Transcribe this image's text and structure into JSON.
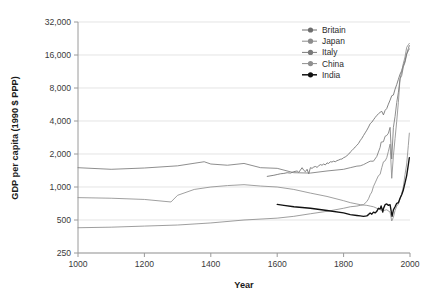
{
  "chart_data": {
    "type": "line",
    "title": "",
    "xlabel": "Year",
    "ylabel": "GDP per capita (1990 $ PPP)",
    "xlim": [
      1000,
      2000
    ],
    "ylim": [
      250,
      32000
    ],
    "yscale": "log2",
    "grid": true,
    "legend_position": "top-right",
    "xticks": [
      "1000",
      "1200",
      "1400",
      "1600",
      "1800",
      "2000"
    ],
    "xtick_values": [
      1000,
      1200,
      1400,
      1600,
      1800,
      2000
    ],
    "yticks": [
      "250",
      "500",
      "1,000",
      "2,000",
      "4,000",
      "8,000",
      "16,000",
      "32,000"
    ],
    "ytick_values": [
      250,
      500,
      1000,
      2000,
      4000,
      8000,
      16000,
      32000
    ],
    "series": [
      {
        "name": "Britain",
        "color": "#6e6e6e",
        "marker": "circle",
        "x": [
          1570,
          1590,
          1600,
          1610,
          1620,
          1630,
          1640,
          1650,
          1660,
          1665,
          1670,
          1675,
          1680,
          1685,
          1690,
          1695,
          1700,
          1705,
          1710,
          1715,
          1720,
          1725,
          1730,
          1735,
          1740,
          1745,
          1750,
          1755,
          1760,
          1765,
          1770,
          1775,
          1780,
          1785,
          1790,
          1795,
          1800,
          1805,
          1810,
          1815,
          1820,
          1825,
          1830,
          1835,
          1840,
          1845,
          1850,
          1855,
          1860,
          1865,
          1870,
          1875,
          1880,
          1885,
          1890,
          1895,
          1900,
          1905,
          1910,
          1915,
          1920,
          1925,
          1930,
          1935,
          1940,
          1945,
          1950,
          1955,
          1960,
          1965,
          1970,
          1975,
          1980,
          1985,
          1990,
          1995,
          1998
        ],
        "y": [
          1250,
          1280,
          1300,
          1320,
          1330,
          1350,
          1340,
          1380,
          1400,
          1360,
          1430,
          1500,
          1420,
          1380,
          1450,
          1320,
          1500,
          1480,
          1520,
          1540,
          1510,
          1560,
          1600,
          1580,
          1620,
          1590,
          1660,
          1640,
          1700,
          1690,
          1720,
          1700,
          1740,
          1760,
          1790,
          1800,
          1850,
          1880,
          1930,
          1990,
          2080,
          2150,
          2230,
          2320,
          2400,
          2500,
          2650,
          2780,
          2950,
          3120,
          3300,
          3520,
          3780,
          3900,
          4100,
          4300,
          4500,
          4650,
          4800,
          4900,
          4550,
          5000,
          5200,
          5700,
          6200,
          6800,
          6900,
          7800,
          8600,
          9600,
          10700,
          11500,
          12900,
          14200,
          16400,
          18300,
          19500
        ]
      },
      {
        "name": "Japan",
        "color": "#8c8c8c",
        "marker": "circle",
        "x": [
          1000,
          1100,
          1200,
          1300,
          1400,
          1500,
          1600,
          1650,
          1700,
          1750,
          1800,
          1820,
          1840,
          1850,
          1860,
          1870,
          1875,
          1880,
          1885,
          1890,
          1895,
          1900,
          1905,
          1910,
          1915,
          1920,
          1925,
          1930,
          1935,
          1940,
          1945,
          1950,
          1955,
          1960,
          1965,
          1970,
          1975,
          1980,
          1985,
          1990,
          1995,
          1998
        ],
        "y": [
          425,
          430,
          440,
          450,
          470,
          500,
          520,
          540,
          570,
          600,
          640,
          660,
          670,
          680,
          690,
          737,
          780,
          850,
          900,
          1012,
          1090,
          1180,
          1270,
          1304,
          1500,
          1696,
          1730,
          1850,
          2120,
          2460,
          1200,
          1921,
          2770,
          3986,
          5930,
          9714,
          11344,
          13428,
          15331,
          18789,
          19850,
          20400
        ]
      },
      {
        "name": "Italy",
        "color": "#7a7a7a",
        "marker": "circle",
        "x": [
          1000,
          1100,
          1200,
          1300,
          1380,
          1400,
          1450,
          1500,
          1550,
          1600,
          1650,
          1700,
          1750,
          1800,
          1820,
          1840,
          1850,
          1860,
          1870,
          1880,
          1890,
          1900,
          1910,
          1913,
          1920,
          1925,
          1930,
          1935,
          1940,
          1945,
          1950,
          1955,
          1960,
          1965,
          1970,
          1975,
          1980,
          1985,
          1990,
          1995,
          1998
        ],
        "y": [
          1500,
          1450,
          1490,
          1560,
          1700,
          1620,
          1580,
          1640,
          1500,
          1480,
          1350,
          1340,
          1400,
          1450,
          1500,
          1550,
          1560,
          1600,
          1660,
          1720,
          1720,
          1900,
          2300,
          2564,
          2590,
          2900,
          2950,
          3100,
          3500,
          1800,
          3502,
          4400,
          5900,
          7300,
          9700,
          10400,
          12500,
          13700,
          16300,
          17500,
          18200
        ]
      },
      {
        "name": "China",
        "color": "#8f8f8f",
        "marker": "circle",
        "x": [
          1000,
          1100,
          1200,
          1280,
          1300,
          1350,
          1400,
          1450,
          1500,
          1550,
          1600,
          1650,
          1700,
          1750,
          1800,
          1820,
          1840,
          1850,
          1870,
          1880,
          1890,
          1900,
          1910,
          1913,
          1920,
          1930,
          1940,
          1945,
          1950,
          1955,
          1960,
          1965,
          1970,
          1975,
          1980,
          1985,
          1990,
          1995,
          1998
        ],
        "y": [
          800,
          790,
          770,
          730,
          840,
          950,
          1000,
          1030,
          1050,
          1020,
          1000,
          950,
          880,
          820,
          750,
          720,
          700,
          690,
          680,
          670,
          660,
          640,
          620,
          615,
          610,
          620,
          590,
          490,
          530,
          610,
          670,
          700,
          780,
          870,
          1010,
          1300,
          1620,
          2400,
          3100
        ]
      },
      {
        "name": "India",
        "color": "#111111",
        "marker": "circle",
        "x": [
          1600,
          1620,
          1650,
          1700,
          1750,
          1800,
          1820,
          1840,
          1850,
          1860,
          1870,
          1875,
          1880,
          1885,
          1890,
          1895,
          1900,
          1905,
          1910,
          1913,
          1918,
          1920,
          1925,
          1930,
          1935,
          1940,
          1943,
          1946,
          1950,
          1955,
          1960,
          1965,
          1970,
          1975,
          1980,
          1985,
          1990,
          1995,
          1998
        ],
        "y": [
          695,
          680,
          660,
          640,
          610,
          580,
          560,
          550,
          545,
          540,
          545,
          560,
          580,
          565,
          590,
          580,
          600,
          640,
          630,
          673,
          590,
          635,
          690,
          700,
          680,
          690,
          610,
          540,
          619,
          660,
          710,
          720,
          790,
          850,
          940,
          1090,
          1270,
          1600,
          1850
        ]
      }
    ]
  },
  "legend": {
    "items": [
      {
        "label": "Britain"
      },
      {
        "label": "Japan"
      },
      {
        "label": "Italy"
      },
      {
        "label": "China"
      },
      {
        "label": "India"
      }
    ]
  },
  "axes": {
    "x_title": "Year",
    "y_title": "GDP per capita (1990 $ PPP)"
  },
  "colors": {
    "background": "#ffffff",
    "gridline": "#d9d9d9",
    "axis": "#9a9a9a",
    "text": "#1a1a1a"
  }
}
